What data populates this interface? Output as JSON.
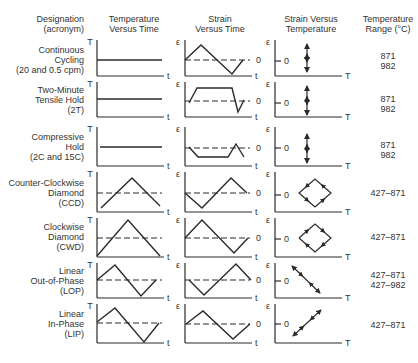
{
  "headers": {
    "designation": [
      "Designation",
      "(acronym)"
    ],
    "temp_time": [
      "Temperature",
      "Versus Time"
    ],
    "strain_time": [
      "Strain",
      "Versus Time"
    ],
    "strain_temp": [
      "Strain Versus",
      "Temperature"
    ],
    "range": [
      "Temperature",
      "Range (°C)"
    ]
  },
  "axis_labels": {
    "temperature": "T",
    "time": "t",
    "strain": "ε",
    "zero": "0"
  },
  "rows": [
    {
      "name": [
        "Continuous",
        "Cycling",
        "(20 and 0.5 cpm)"
      ],
      "range": [
        "871",
        "982"
      ]
    },
    {
      "name": [
        "Two-Minute",
        "Tensile Hold",
        "(2T)"
      ],
      "range": [
        "871",
        "982"
      ]
    },
    {
      "name": [
        "Compressive",
        "Hold",
        "(2C and 15C)"
      ],
      "range": [
        "871",
        "982"
      ]
    },
    {
      "name": [
        "Counter-Clockwise",
        "Diamond",
        "(CCD)"
      ],
      "range": [
        "427–871"
      ]
    },
    {
      "name": [
        "Clockwise",
        "Diamond",
        "(CWD)"
      ],
      "range": [
        "427–871"
      ]
    },
    {
      "name": [
        "Linear",
        "Out-of-Phase",
        "(LOP)"
      ],
      "range": [
        "427–871",
        "427–982"
      ]
    },
    {
      "name": [
        "Linear",
        "In-Phase",
        "(LIP)"
      ],
      "range": [
        "427–871"
      ]
    }
  ],
  "row_geometry": [
    {
      "top": 40,
      "bottom": 76
    },
    {
      "top": 82,
      "bottom": 117
    },
    {
      "top": 127,
      "bottom": 166
    },
    {
      "top": 172,
      "bottom": 212
    },
    {
      "top": 218,
      "bottom": 257
    },
    {
      "top": 263,
      "bottom": 298
    },
    {
      "top": 304,
      "bottom": 343
    }
  ],
  "waveforms": {
    "temp_time": [
      {
        "type": "const",
        "y": 60
      },
      {
        "type": "const",
        "y": 99
      },
      {
        "type": "const",
        "y": 147
      },
      {
        "type": "poly",
        "pts": [
          [
            101,
            208
          ],
          [
            132,
            178
          ],
          [
            160,
            206
          ]
        ],
        "dash_y": 193
      },
      {
        "type": "poly",
        "pts": [
          [
            97,
            256
          ],
          [
            128,
            220
          ],
          [
            160,
            256
          ]
        ],
        "dash_y": 238
      },
      {
        "type": "poly",
        "pts": [
          [
            97,
            280
          ],
          [
            115,
            265
          ],
          [
            141,
            296
          ],
          [
            156,
            280
          ]
        ],
        "dash_y": 280
      },
      {
        "type": "poly",
        "pts": [
          [
            97,
            322
          ],
          [
            115,
            308
          ],
          [
            144,
            342
          ],
          [
            159,
            323
          ]
        ],
        "dash_y": 323
      }
    ],
    "strain_time": [
      {
        "pts": [
          [
            185,
            60
          ],
          [
            201,
            45
          ],
          [
            232,
            74
          ],
          [
            243,
            60
          ]
        ],
        "dash_y": 60
      },
      {
        "pts": [
          [
            189,
            103
          ],
          [
            197,
            88
          ],
          [
            232,
            88
          ],
          [
            238,
            112
          ],
          [
            244,
            100
          ]
        ],
        "dash_y": 101
      },
      {
        "pts": [
          [
            189,
            147
          ],
          [
            198,
            157
          ],
          [
            228,
            157
          ],
          [
            236,
            144
          ],
          [
            244,
            157
          ]
        ],
        "dash_y": 148
      },
      {
        "pts": [
          [
            185,
            193
          ],
          [
            202,
            208
          ],
          [
            231,
            178
          ],
          [
            247,
            193
          ]
        ],
        "dash_y": 193
      },
      {
        "pts": [
          [
            185,
            238
          ],
          [
            202,
            220
          ],
          [
            234,
            253
          ],
          [
            248,
            238
          ]
        ],
        "dash_y": 238
      },
      {
        "pts": [
          [
            189,
            280
          ],
          [
            204,
            295
          ],
          [
            236,
            264
          ],
          [
            251,
            280
          ]
        ],
        "dash_y": 280
      },
      {
        "pts": [
          [
            186,
            324
          ],
          [
            203,
            311
          ],
          [
            233,
            339
          ],
          [
            250,
            324
          ]
        ],
        "dash_y": 324
      }
    ],
    "strain_temp": [
      {
        "type": "vertical",
        "x": 307,
        "y1": 44,
        "y2": 72,
        "zero_y": 61
      },
      {
        "type": "vertical",
        "x": 307,
        "y1": 86,
        "y2": 115,
        "zero_y": 103
      },
      {
        "type": "vertical",
        "x": 307,
        "y1": 134,
        "y2": 163,
        "zero_y": 148
      },
      {
        "type": "diamond",
        "cx": 315,
        "cy": 193,
        "rx": 16,
        "ry": 14,
        "zero_y": 195,
        "dir": "ccw"
      },
      {
        "type": "diamond",
        "cx": 315,
        "cy": 238,
        "rx": 16,
        "ry": 14,
        "zero_y": 239,
        "dir": "cw"
      },
      {
        "type": "line",
        "x1": 292,
        "y1": 266,
        "x2": 320,
        "y2": 293,
        "zero_y": 281
      },
      {
        "type": "line",
        "x1": 293,
        "y1": 336,
        "x2": 321,
        "y2": 310,
        "zero_y": 324
      }
    ]
  },
  "colors": {
    "stroke": "#2a2a2a",
    "text": "#333333",
    "background": "#ffffff"
  }
}
